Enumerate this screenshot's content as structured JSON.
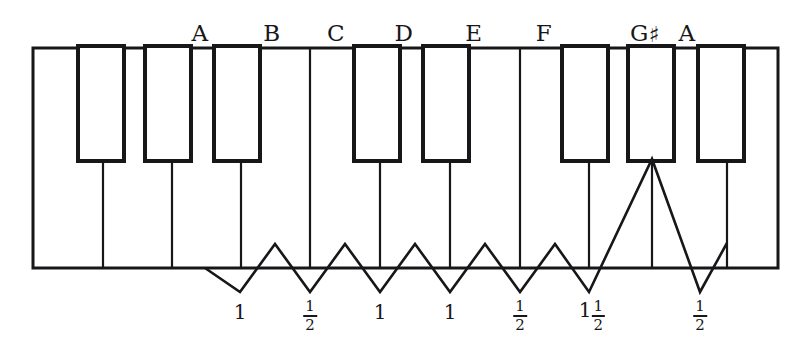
{
  "figure": {
    "ink_color": "#17171a",
    "key_fill": "#ffffff",
    "background": "#ffffff"
  },
  "note_labels": [
    {
      "id": "note-a",
      "text": "A",
      "sharp": false,
      "x": 200
    },
    {
      "id": "note-b",
      "text": "B",
      "sharp": false,
      "x": 272
    },
    {
      "id": "note-c",
      "text": "C",
      "sharp": false,
      "x": 336
    },
    {
      "id": "note-d",
      "text": "D",
      "sharp": false,
      "x": 404
    },
    {
      "id": "note-e",
      "text": "E",
      "sharp": false,
      "x": 474
    },
    {
      "id": "note-f",
      "text": "F",
      "sharp": false,
      "x": 544
    },
    {
      "id": "note-g-sharp",
      "text": "G",
      "sharp": true,
      "x": 645
    },
    {
      "id": "note-a-high",
      "text": "A",
      "sharp": false,
      "x": 687
    }
  ],
  "interval_labels": [
    {
      "id": "interval-1",
      "whole": "1",
      "numerator": "",
      "denominator": "",
      "display": "1",
      "x": 240
    },
    {
      "id": "interval-half-1",
      "whole": "",
      "numerator": "1",
      "denominator": "2",
      "display": "1/2",
      "x": 310
    },
    {
      "id": "interval-2",
      "whole": "1",
      "numerator": "",
      "denominator": "",
      "display": "1",
      "x": 380
    },
    {
      "id": "interval-3",
      "whole": "1",
      "numerator": "",
      "denominator": "",
      "display": "1",
      "x": 450
    },
    {
      "id": "interval-half-2",
      "whole": "",
      "numerator": "1",
      "denominator": "2",
      "display": "1/2",
      "x": 520
    },
    {
      "id": "interval-one-half",
      "whole": "1",
      "numerator": "1",
      "denominator": "2",
      "display": "1 1/2",
      "x": 592
    },
    {
      "id": "interval-half-3",
      "whole": "",
      "numerator": "1",
      "denominator": "2",
      "display": "1/2",
      "x": 700
    }
  ],
  "keyboard_geometry": {
    "frame": {
      "x": 33,
      "y": 48,
      "width": 745,
      "height": 220
    },
    "white_key_dividers_x": [
      103,
      172,
      241,
      310,
      380,
      450,
      520,
      589,
      658,
      727
    ],
    "black_keys": [
      {
        "id": "black-key-1",
        "x": 78,
        "width": 46,
        "top": 48,
        "bottom": 161
      },
      {
        "id": "black-key-2",
        "x": 145,
        "width": 46,
        "top": 48,
        "bottom": 161
      },
      {
        "id": "black-key-3",
        "x": 214,
        "width": 46,
        "top": 48,
        "bottom": 161
      },
      {
        "id": "black-key-4",
        "x": 354,
        "width": 46,
        "top": 48,
        "bottom": 161
      },
      {
        "id": "black-key-5",
        "x": 423,
        "width": 46,
        "top": 48,
        "bottom": 161
      },
      {
        "id": "black-key-6",
        "x": 562,
        "width": 46,
        "top": 48,
        "bottom": 161
      },
      {
        "id": "black-key-7",
        "x": 628,
        "width": 46,
        "top": 48,
        "bottom": 161
      },
      {
        "id": "black-key-8",
        "x": 698,
        "width": 46,
        "top": 48,
        "bottom": 161
      }
    ],
    "zigzag_baseline_y": 268,
    "zigzag_points": "205,268 240,290 275,245 310,290 345,245 380,290 415,245 450,290 485,245 520,290 555,245 589,290 652,160 700,290 727,245"
  }
}
